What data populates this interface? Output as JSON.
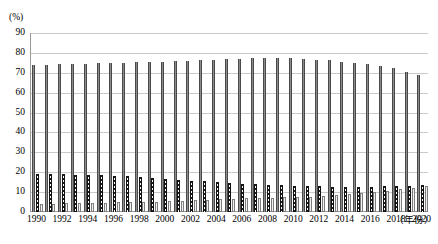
{
  "chart_data": {
    "type": "bar",
    "title": "",
    "xlabel": "（年份）",
    "ylabel": "(%)",
    "ylim": [
      0,
      90
    ],
    "ytick_step": 10,
    "grid": true,
    "legend_position": "none",
    "x": [
      1990,
      1991,
      1992,
      1993,
      1994,
      1995,
      1996,
      1997,
      1998,
      1999,
      2000,
      2001,
      2002,
      2003,
      2004,
      2005,
      2006,
      2007,
      2008,
      2009,
      2010,
      2011,
      2012,
      2013,
      2014,
      2015,
      2016,
      2017,
      2018,
      2019,
      2020
    ],
    "xtick_labels": [
      "1990",
      "1992",
      "1994",
      "1996",
      "1998",
      "2000",
      "2002",
      "2004",
      "2006",
      "2008",
      "2010",
      "2012",
      "2014",
      "2016",
      "2018",
      "2020"
    ],
    "ytick_labels": [
      "0",
      "10",
      "20",
      "30",
      "40",
      "50",
      "60",
      "70",
      "80",
      "90"
    ],
    "series": [
      {
        "name": "15-64岁人口比重",
        "style": "solid-grey",
        "color": "#8c8c8c",
        "values": [
          74.0,
          74.1,
          74.3,
          74.5,
          74.6,
          74.8,
          74.9,
          75.0,
          75.3,
          75.4,
          75.6,
          75.8,
          76.0,
          76.3,
          76.5,
          76.8,
          77.0,
          77.4,
          77.5,
          77.5,
          77.6,
          77.0,
          76.6,
          76.2,
          75.6,
          75.1,
          74.2,
          73.2,
          72.5,
          70.3,
          69.0
        ],
        "bar_tops_note": "tall solid grey bars"
      },
      {
        "name": "0-14岁人口比重",
        "style": "dark-dotted",
        "color": "#1a1a1a",
        "values": [
          19.2,
          19.1,
          19.0,
          18.8,
          18.6,
          18.4,
          18.2,
          18.0,
          17.6,
          17.2,
          16.8,
          16.3,
          15.8,
          15.4,
          15.0,
          14.6,
          14.2,
          13.9,
          13.6,
          13.4,
          13.2,
          13.0,
          12.9,
          12.8,
          12.7,
          12.6,
          12.7,
          12.9,
          13.0,
          13.3,
          13.6
        ],
        "bar_tops_note": "medium dark checkered bars"
      },
      {
        "name": "65岁及以上人口比重",
        "style": "light-outline",
        "color": "#f2f2f2",
        "values": [
          4.1,
          4.2,
          4.3,
          4.4,
          4.5,
          4.6,
          4.8,
          5.0,
          5.1,
          5.2,
          5.4,
          5.6,
          5.8,
          6.0,
          6.3,
          6.5,
          6.8,
          7.0,
          7.2,
          7.4,
          7.6,
          7.8,
          8.2,
          8.6,
          9.1,
          9.6,
          10.2,
          10.8,
          11.4,
          12.0,
          13.0
        ],
        "bar_tops_note": "short light outlined bars"
      }
    ]
  },
  "axis": {
    "unit_label": "(%)",
    "x_title": "（年份）"
  }
}
